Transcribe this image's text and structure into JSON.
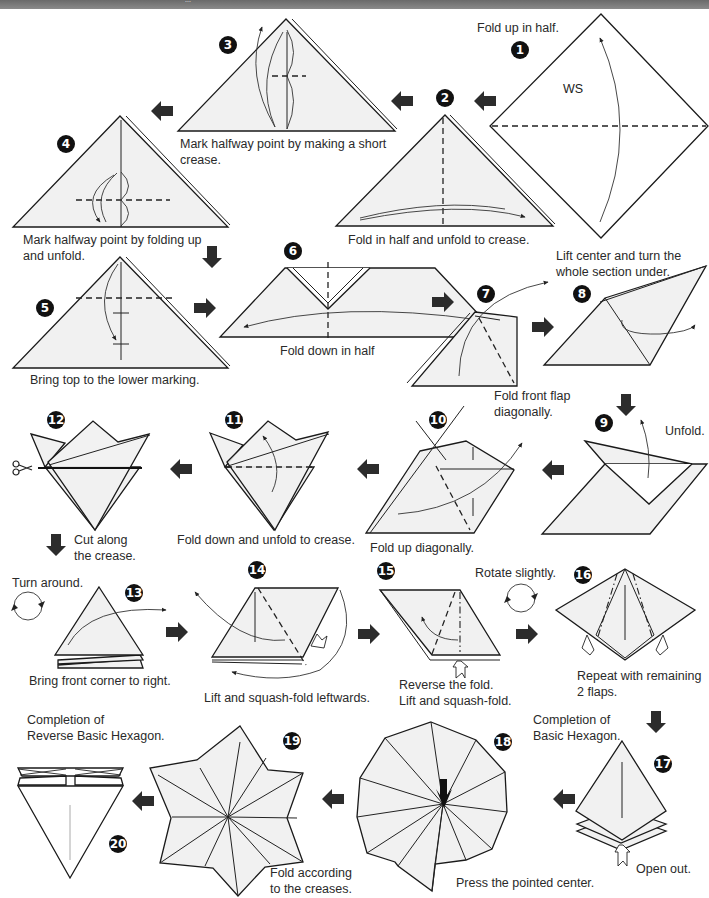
{
  "header": {
    "subtitle": "..."
  },
  "steps": [
    {
      "n": "1",
      "label": "Fold up in half.",
      "side_label": "WS"
    },
    {
      "n": "2",
      "label": "Fold in half and unfold to crease."
    },
    {
      "n": "3",
      "label": "Mark halfway point by making a short\ncrease."
    },
    {
      "n": "4",
      "label": "Mark halfway point by folding up\nand unfold."
    },
    {
      "n": "5",
      "label": "Bring top to the lower marking."
    },
    {
      "n": "6",
      "label": "Fold down in half"
    },
    {
      "n": "7",
      "label": "Fold front flap\ndiagonally."
    },
    {
      "n": "8",
      "label": "Lift center and turn the\nwhole section under."
    },
    {
      "n": "9",
      "label": "Unfold."
    },
    {
      "n": "10",
      "label": "Fold up diagonally."
    },
    {
      "n": "11",
      "label": "Fold down and unfold to crease."
    },
    {
      "n": "12",
      "label": "Cut along\nthe crease."
    },
    {
      "n": "13",
      "label": "Bring front corner to right.",
      "pre_label": "Turn around."
    },
    {
      "n": "14",
      "label": "Lift and squash-fold leftwards."
    },
    {
      "n": "15",
      "label": "Reverse the fold.\nLift and squash-fold.",
      "pre_label": "Rotate slightly."
    },
    {
      "n": "16",
      "label": "Repeat with remaining\n2 flaps."
    },
    {
      "n": "17",
      "label": "Open out.",
      "pre_label": "Completion of\nBasic Hexagon."
    },
    {
      "n": "18",
      "label": "Press the pointed center."
    },
    {
      "n": "19",
      "label": "Fold according\nto the creases."
    },
    {
      "n": "20",
      "label": "Completion of\nReverse Basic Hexagon."
    }
  ],
  "colors": {
    "paper": "#f1f1f1",
    "ink": "#1a1a1a",
    "header": "#777777"
  }
}
